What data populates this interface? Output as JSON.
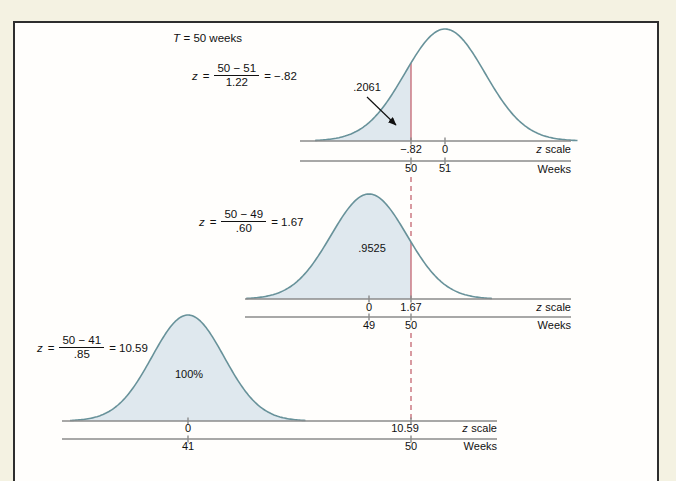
{
  "colors": {
    "page_bg": "#f4f2e2",
    "panel_bg": "#fffefc",
    "frame_border": "#2e2e2e",
    "curve": "#68929a",
    "area_fill": "#dfe8ee",
    "marker_red": "#c8707b",
    "axis_gray": "#8b8b8b",
    "text": "#111111"
  },
  "title_annotation": {
    "var": "T",
    "rest": "= 50 weeks"
  },
  "chart_data": [
    {
      "type": "area",
      "curve": "normal-distribution",
      "mean_weeks": 51,
      "sigma_weeks": 1.22,
      "target_weeks": 50,
      "formula": {
        "var": "z",
        "eq": "=",
        "num": "50 − 51",
        "den": "1.22",
        "result": "= −.82"
      },
      "z_value": -0.82,
      "probability": 0.2061,
      "area_label": ".2061",
      "shaded_region": "left tail up to z = −.82",
      "z_ticks": [
        "−.82",
        "0"
      ],
      "week_ticks": [
        "50",
        "51"
      ],
      "z_axis_label": {
        "var": "z",
        "word": "scale"
      },
      "week_axis_label": "Weeks"
    },
    {
      "type": "area",
      "curve": "normal-distribution",
      "mean_weeks": 49,
      "sigma_weeks": 0.6,
      "target_weeks": 50,
      "formula": {
        "var": "z",
        "eq": "=",
        "num": "50 − 49",
        "den": ".60",
        "result": "= 1.67"
      },
      "z_value": 1.67,
      "probability": 0.9525,
      "area_label": ".9525",
      "shaded_region": "area up to z = 1.67",
      "z_ticks": [
        "0",
        "1.67"
      ],
      "week_ticks": [
        "49",
        "50"
      ],
      "z_axis_label": {
        "var": "z",
        "word": "scale"
      },
      "week_axis_label": "Weeks"
    },
    {
      "type": "area",
      "curve": "normal-distribution",
      "mean_weeks": 41,
      "sigma_weeks": 0.85,
      "target_weeks": 50,
      "formula": {
        "var": "z",
        "eq": "=",
        "num": "50 − 41",
        "den": ".85",
        "result": "= 10.59"
      },
      "z_value": 10.59,
      "probability": 1.0,
      "area_label": "100%",
      "shaded_region": "entire curve",
      "z_ticks": [
        "0",
        "10.59"
      ],
      "week_ticks": [
        "41",
        "50"
      ],
      "z_axis_label": {
        "var": "z",
        "word": "scale"
      },
      "week_axis_label": "Weeks"
    }
  ]
}
